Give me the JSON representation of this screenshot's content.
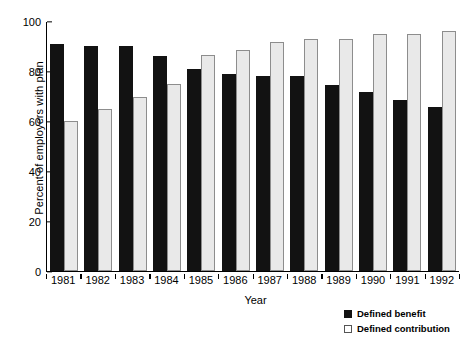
{
  "chart_data": {
    "type": "bar",
    "title": "",
    "xlabel": "Year",
    "ylabel": "Percent of employers with plan",
    "categories": [
      "1981",
      "1982",
      "1983",
      "1984",
      "1985",
      "1986",
      "1987",
      "1988",
      "1989",
      "1990",
      "1991",
      "1992"
    ],
    "series": [
      {
        "name": "Defined benefit",
        "color": "#121212",
        "values": [
          91,
          90,
          90,
          86,
          81,
          79,
          78,
          78,
          74.5,
          71.5,
          68.5,
          65.5
        ]
      },
      {
        "name": "Defined contribution",
        "color": "#e9e9e9",
        "values": [
          60,
          65,
          69.5,
          75,
          86.5,
          88.5,
          91.5,
          93,
          93,
          95,
          95,
          96
        ]
      }
    ],
    "ylim": [
      0,
      100
    ],
    "yticks": [
      0,
      20,
      40,
      60,
      80,
      100
    ],
    "ytick_labels": [
      "0",
      "20",
      "40",
      "60",
      "80",
      "100"
    ],
    "grid": false,
    "legend_position": "bottom-right"
  },
  "legend": {
    "items": [
      {
        "label": "Defined benefit"
      },
      {
        "label": "Defined contribution"
      }
    ]
  }
}
